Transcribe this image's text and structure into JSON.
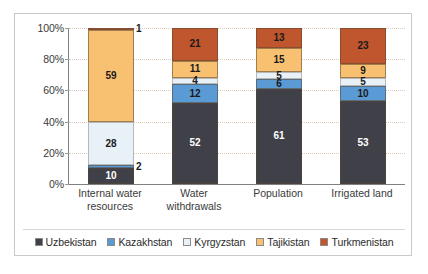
{
  "chart_data": {
    "type": "bar",
    "subtype": "stacked-percent",
    "title": "",
    "xlabel": "",
    "ylabel": "",
    "ylim": [
      0,
      100
    ],
    "ytick_labels": [
      "0%",
      "20%",
      "40%",
      "60%",
      "80%",
      "100%"
    ],
    "ytick_values": [
      0,
      20,
      40,
      60,
      80,
      100
    ],
    "grid": true,
    "legend_position": "bottom",
    "categories": [
      "Internal water resources",
      "Water withdrawals",
      "Population",
      "Irrigated land"
    ],
    "category_lines": [
      [
        "Internal water",
        "resources"
      ],
      [
        "Water withdrawals"
      ],
      [
        "Population"
      ],
      [
        "Irrigated land"
      ]
    ],
    "series": [
      {
        "name": "Uzbekistan",
        "color": "#404048",
        "label_color": "#ffffff",
        "values": [
          10,
          52,
          61,
          53
        ]
      },
      {
        "name": "Kazakhstan",
        "color": "#5B9BD5",
        "label_color": "#1a1a1a",
        "values": [
          2,
          12,
          6,
          10
        ]
      },
      {
        "name": "Kyrgyzstan",
        "color": "#E8F0F8",
        "label_color": "#1a1a1a",
        "values": [
          28,
          4,
          5,
          5
        ]
      },
      {
        "name": "Tajikistan",
        "color": "#F8C171",
        "label_color": "#1a1a1a",
        "values": [
          59,
          11,
          15,
          9
        ]
      },
      {
        "name": "Turkmenistan",
        "color": "#C0562E",
        "label_color": "#1a1a1a",
        "values": [
          1,
          21,
          13,
          23
        ]
      }
    ]
  },
  "legend": {
    "items": [
      {
        "label": "Uzbekistan",
        "color": "#404048"
      },
      {
        "label": "Kazakhstan",
        "color": "#5B9BD5"
      },
      {
        "label": "Kyrgyzstan",
        "color": "#E8F0F8"
      },
      {
        "label": "Tajikistan",
        "color": "#F8C171"
      },
      {
        "label": "Turkmenistan",
        "color": "#C0562E"
      }
    ]
  }
}
